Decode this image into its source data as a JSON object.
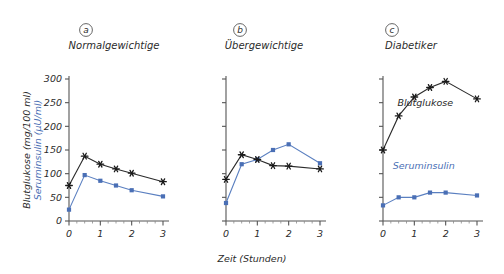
{
  "figure": {
    "background": "#ffffff",
    "axis_color": "#555555",
    "glucose_color": "#1a1a1a",
    "insulin_color": "#4a6fb5",
    "x_axis_title": "Zeit (Stunden)",
    "y_axis_title_glucose": "Blutglukose (mg/100 ml)",
    "y_axis_title_insulin": "Seruminsulin (µU/ml)",
    "series_label_glucose": "Blutglukose",
    "series_label_insulin": "Seruminsulin",
    "y_tick_labels": [
      "0",
      "50",
      "100",
      "150",
      "200",
      "250",
      "300"
    ],
    "x_tick_labels": [
      "0",
      "1",
      "2",
      "3"
    ],
    "panels": [
      {
        "letter": "a",
        "title": "Normalgewichtige",
        "show_y_labels": true
      },
      {
        "letter": "b",
        "title": "Übergewichtige",
        "show_y_labels": false
      },
      {
        "letter": "c",
        "title": "Diabetiker",
        "show_y_labels": false
      }
    ]
  },
  "chart_data": [
    {
      "type": "line",
      "title": "Normalgewichtige",
      "panel": "a",
      "xlabel": "Zeit (Stunden)",
      "ylabel": "Blutglukose (mg/100 ml) / Seruminsulin (µU/ml)",
      "xlim": [
        0,
        3
      ],
      "ylim": [
        0,
        300
      ],
      "yticks": [
        0,
        50,
        100,
        150,
        200,
        250,
        300
      ],
      "xticks": [
        0,
        1,
        2,
        3
      ],
      "grid": false,
      "legend": "none",
      "x": [
        0,
        0.5,
        1,
        1.5,
        2,
        3
      ],
      "series": [
        {
          "name": "Blutglukose",
          "color": "#1a1a1a",
          "marker": "star",
          "values": [
            75,
            137,
            120,
            110,
            101,
            83
          ]
        },
        {
          "name": "Seruminsulin",
          "color": "#4a6fb5",
          "marker": "square",
          "values": [
            24,
            97,
            85,
            75,
            65,
            52
          ]
        }
      ]
    },
    {
      "type": "line",
      "title": "Übergewichtige",
      "panel": "b",
      "xlabel": "Zeit (Stunden)",
      "ylabel": "Blutglukose (mg/100 ml) / Seruminsulin (µU/ml)",
      "xlim": [
        0,
        3
      ],
      "ylim": [
        0,
        300
      ],
      "yticks": [
        0,
        50,
        100,
        150,
        200,
        250,
        300
      ],
      "xticks": [
        0,
        1,
        2,
        3
      ],
      "grid": false,
      "legend": "none",
      "x": [
        0,
        0.5,
        1,
        1.5,
        2,
        3
      ],
      "series": [
        {
          "name": "Blutglukose",
          "color": "#1a1a1a",
          "marker": "star",
          "values": [
            88,
            140,
            130,
            117,
            116,
            110
          ]
        },
        {
          "name": "Seruminsulin",
          "color": "#4a6fb5",
          "marker": "square",
          "values": [
            38,
            120,
            130,
            150,
            162,
            122
          ]
        }
      ]
    },
    {
      "type": "line",
      "title": "Diabetiker",
      "panel": "c",
      "xlabel": "Zeit (Stunden)",
      "ylabel": "Blutglukose (mg/100 ml) / Seruminsulin (µU/ml)",
      "xlim": [
        0,
        3
      ],
      "ylim": [
        0,
        300
      ],
      "yticks": [
        0,
        50,
        100,
        150,
        200,
        250,
        300
      ],
      "xticks": [
        0,
        1,
        2,
        3
      ],
      "grid": false,
      "legend": "inline",
      "annotations": [
        {
          "text": "Blutglukose",
          "x": 1.35,
          "y": 243
        },
        {
          "text": "Seruminsulin",
          "x": 1.3,
          "y": 110
        }
      ],
      "x": [
        0,
        0.5,
        1,
        1.5,
        2,
        3
      ],
      "series": [
        {
          "name": "Blutglukose",
          "color": "#1a1a1a",
          "marker": "star",
          "values": [
            150,
            222,
            262,
            282,
            295,
            258
          ]
        },
        {
          "name": "Seruminsulin",
          "color": "#4a6fb5",
          "marker": "square",
          "values": [
            33,
            50,
            50,
            60,
            60,
            54
          ]
        }
      ]
    }
  ]
}
